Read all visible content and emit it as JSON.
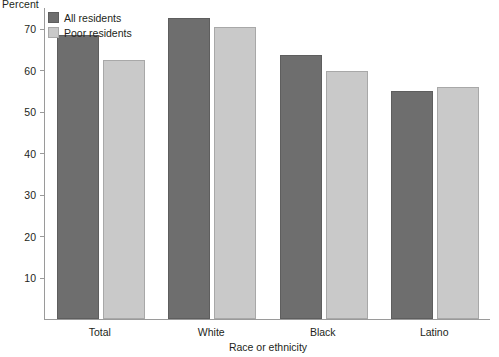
{
  "chart_data": {
    "type": "bar",
    "title": "",
    "ylabel": "Percent",
    "xlabel": "Race or ethnicity",
    "categories": [
      "Total",
      "White",
      "Black",
      "Latino"
    ],
    "series": [
      {
        "name": "All residents",
        "color": "#6e6e6e",
        "values": [
          68,
          72,
          63.3,
          54.5
        ]
      },
      {
        "name": "Poor residents",
        "color": "#c9c9c9",
        "values": [
          62,
          70,
          59.3,
          55.5
        ]
      }
    ],
    "ylim": [
      0,
      75
    ],
    "yticks": [
      10,
      20,
      30,
      40,
      50,
      60,
      70
    ],
    "grid": false,
    "legend_position": "top-left"
  }
}
